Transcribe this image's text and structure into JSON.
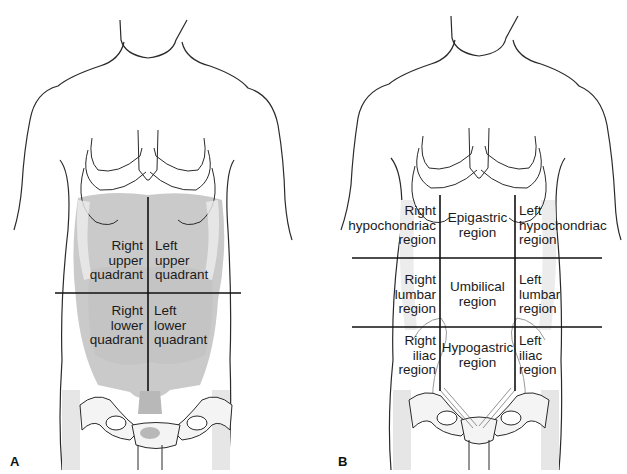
{
  "figure": {
    "panels": [
      {
        "letter": "A",
        "title": "Abdominal quadrants",
        "divisions": {
          "vertical_lines": 1,
          "horizontal_lines": 1
        },
        "regions": [
          {
            "id": "ruq",
            "lines": [
              "Right",
              "upper",
              "quadrant"
            ]
          },
          {
            "id": "luq",
            "lines": [
              "Left",
              "upper",
              "quadrant"
            ]
          },
          {
            "id": "rlq",
            "lines": [
              "Right",
              "lower",
              "quadrant"
            ]
          },
          {
            "id": "llq",
            "lines": [
              "Left",
              "lower",
              "quadrant"
            ]
          }
        ]
      },
      {
        "letter": "B",
        "title": "Abdominal regions",
        "divisions": {
          "vertical_lines": 2,
          "horizontal_lines": 2
        },
        "regions": [
          {
            "id": "right-hypochondriac",
            "lines": [
              "Right",
              "hypochondriac",
              "region"
            ]
          },
          {
            "id": "epigastric",
            "lines": [
              "Epigastric",
              "region"
            ]
          },
          {
            "id": "left-hypochondriac",
            "lines": [
              "Left",
              "hypochondriac",
              "region"
            ]
          },
          {
            "id": "right-lumbar",
            "lines": [
              "Right",
              "lumbar",
              "region"
            ]
          },
          {
            "id": "umbilical",
            "lines": [
              "Umbilical",
              "region"
            ]
          },
          {
            "id": "left-lumbar",
            "lines": [
              "Left",
              "lumbar",
              "region"
            ]
          },
          {
            "id": "right-iliac",
            "lines": [
              "Right",
              "iliac",
              "region"
            ]
          },
          {
            "id": "hypogastric",
            "lines": [
              "Hypogastric",
              "region"
            ]
          },
          {
            "id": "left-iliac",
            "lines": [
              "Left",
              "iliac",
              "region"
            ]
          }
        ]
      }
    ],
    "colors": {
      "outline": "#2a2a2a",
      "organ_fill": "#c9c9c9",
      "organ_dark": "#b4b4b4",
      "bone_fill": "#f4f4f4",
      "shade": "#e2e2e2",
      "divider": "#111111"
    }
  }
}
